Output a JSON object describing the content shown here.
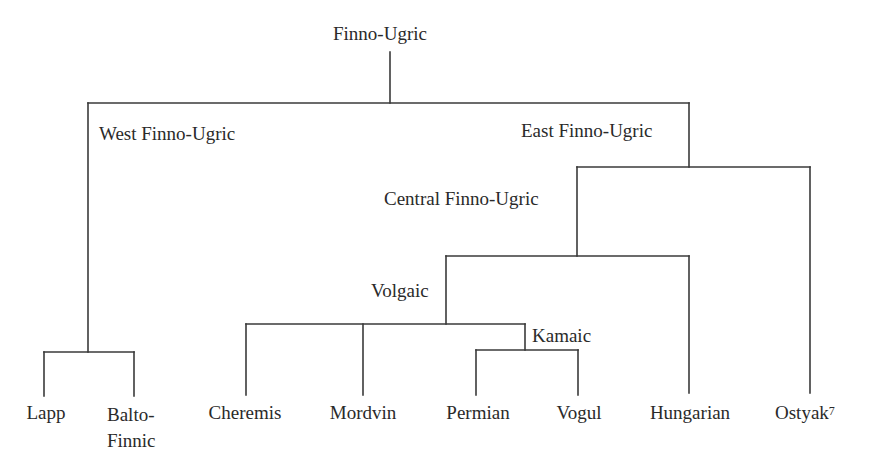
{
  "diagram": {
    "type": "language-family-tree",
    "root": "Finno-Ugric",
    "branches": {
      "west": "West Finno-Ugric",
      "east": "East Finno-Ugric",
      "central": "Central Finno-Ugric",
      "volgaic": "Volgaic",
      "kamaic": "Kamaic"
    },
    "leaves": {
      "lapp": "Lapp",
      "balto_line1": "Balto-",
      "balto_line2": "Finnic",
      "cheremis": "Cheremis",
      "mordvin": "Mordvin",
      "permian": "Permian",
      "vogul": "Vogul",
      "hungarian": "Hungarian",
      "ostyak": "Ostyak",
      "ostyak_footnote": "7"
    },
    "line_color": "#3a3a3a"
  }
}
